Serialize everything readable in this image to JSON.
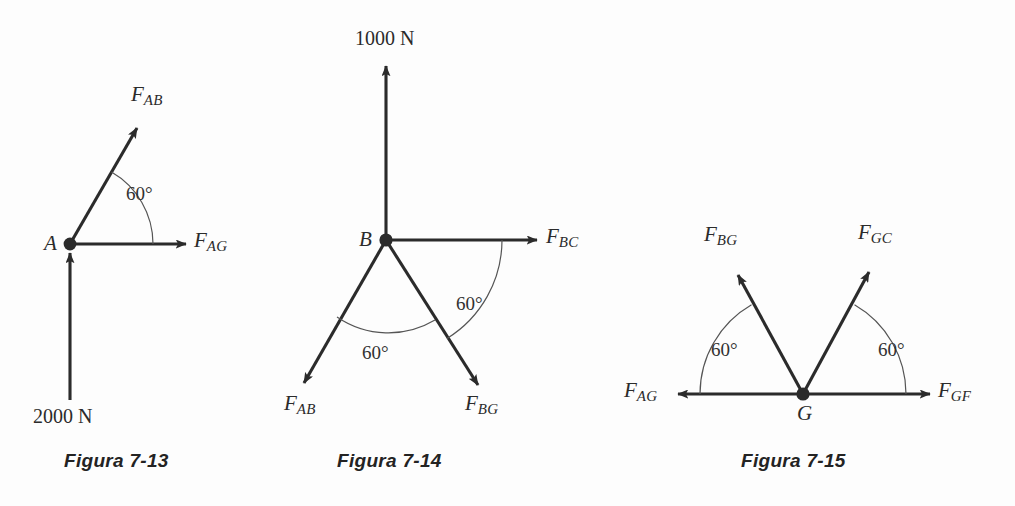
{
  "page": {
    "background_color": "#fdfdfd",
    "ink_color": "#2b2b2b",
    "arc_color": "#555555"
  },
  "figures": [
    {
      "id": "figura-7-13",
      "caption": "Figura 7-13",
      "node_label": "A",
      "forces": [
        {
          "name": "F_AB",
          "base": "F",
          "sub": "AB",
          "direction": "up-right-60deg",
          "arrow": "outward"
        },
        {
          "name": "F_AG",
          "base": "F",
          "sub": "AG",
          "direction": "right",
          "arrow": "outward"
        }
      ],
      "magnitudes": [
        {
          "name": "applied-load",
          "text": "2000 N",
          "direction": "up",
          "arrow": "toward-node"
        }
      ],
      "angles": [
        {
          "text": "60°",
          "between": [
            "F_AG",
            "F_AB"
          ]
        }
      ]
    },
    {
      "id": "figura-7-14",
      "caption": "Figura 7-14",
      "node_label": "B",
      "forces": [
        {
          "name": "F_BC",
          "base": "F",
          "sub": "BC",
          "direction": "right",
          "arrow": "outward"
        },
        {
          "name": "F_BG",
          "base": "F",
          "sub": "BG",
          "direction": "down-right-60deg",
          "arrow": "outward"
        },
        {
          "name": "F_AB",
          "base": "F",
          "sub": "AB",
          "direction": "down-left-60deg",
          "arrow": "outward"
        }
      ],
      "magnitudes": [
        {
          "name": "applied-load",
          "text": "1000 N",
          "direction": "up",
          "arrow": "outward"
        }
      ],
      "angles": [
        {
          "text": "60°",
          "between": [
            "F_BC",
            "F_BG"
          ]
        },
        {
          "text": "60°",
          "between": [
            "F_BG",
            "F_AB"
          ]
        }
      ]
    },
    {
      "id": "figura-7-15",
      "caption": "Figura 7-15",
      "node_label": "G",
      "forces": [
        {
          "name": "F_AG",
          "base": "F",
          "sub": "AG",
          "direction": "left",
          "arrow": "outward"
        },
        {
          "name": "F_GF",
          "base": "F",
          "sub": "GF",
          "direction": "right",
          "arrow": "outward"
        },
        {
          "name": "F_BG",
          "base": "F",
          "sub": "BG",
          "direction": "up-left-60deg",
          "arrow": "outward"
        },
        {
          "name": "F_GC",
          "base": "F",
          "sub": "GC",
          "direction": "up-right-60deg",
          "arrow": "outward"
        }
      ],
      "magnitudes": [],
      "angles": [
        {
          "text": "60°",
          "between": [
            "F_AG",
            "F_BG"
          ]
        },
        {
          "text": "60°",
          "between": [
            "F_GF",
            "F_GC"
          ]
        }
      ]
    }
  ]
}
